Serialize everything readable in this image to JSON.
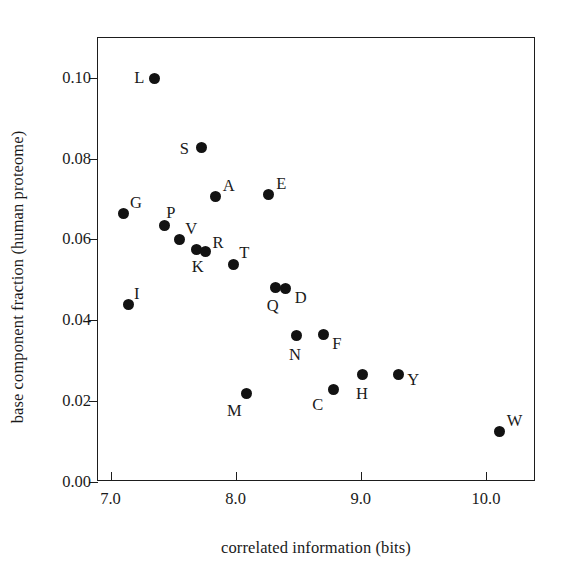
{
  "chart_data": {
    "type": "scatter",
    "title": "",
    "xlabel": "correlated information (bits)",
    "ylabel": "base component fraction (human proteome)",
    "xlim": [
      6.9,
      10.4
    ],
    "ylim": [
      0.0,
      0.1098
    ],
    "xticks": [
      "7.0",
      "8.0",
      "9.0",
      "10.0"
    ],
    "xtick_values": [
      7.0,
      8.0,
      9.0,
      10.0
    ],
    "yticks": [
      "0.00",
      "0.02",
      "0.04",
      "0.06",
      "0.08",
      "0.10"
    ],
    "ytick_values": [
      0.0,
      0.02,
      0.04,
      0.06,
      0.08,
      0.1
    ],
    "grid": false,
    "legend": false,
    "marker": "filled-circle",
    "marker_color": "#121212",
    "points": [
      {
        "label": "L",
        "x": 7.35,
        "y": 0.0999,
        "label_dx": -20,
        "label_dy": -8
      },
      {
        "label": "S",
        "x": 7.73,
        "y": 0.0826,
        "label_dx": -22,
        "label_dy": -7
      },
      {
        "label": "A",
        "x": 7.84,
        "y": 0.0706,
        "label_dx": 7,
        "label_dy": -19
      },
      {
        "label": "E",
        "x": 8.26,
        "y": 0.071,
        "label_dx": 8,
        "label_dy": -19
      },
      {
        "label": "G",
        "x": 7.1,
        "y": 0.0663,
        "label_dx": 7,
        "label_dy": -19
      },
      {
        "label": "P",
        "x": 7.43,
        "y": 0.0634,
        "label_dx": 2,
        "label_dy": -21
      },
      {
        "label": "V",
        "x": 7.55,
        "y": 0.0599,
        "label_dx": 6,
        "label_dy": -19
      },
      {
        "label": "K",
        "x": 7.69,
        "y": 0.0574,
        "label_dx": -5,
        "label_dy": 9
      },
      {
        "label": "R",
        "x": 7.76,
        "y": 0.0569,
        "label_dx": 7,
        "label_dy": -17
      },
      {
        "label": "T",
        "x": 7.98,
        "y": 0.0537,
        "label_dx": 6,
        "label_dy": -20
      },
      {
        "label": "I",
        "x": 7.14,
        "y": 0.0438,
        "label_dx": 6,
        "label_dy": -19
      },
      {
        "label": "Q",
        "x": 8.32,
        "y": 0.048,
        "label_dx": -9,
        "label_dy": 10
      },
      {
        "label": "D",
        "x": 8.4,
        "y": 0.0478,
        "label_dx": 9,
        "label_dy": 1
      },
      {
        "label": "N",
        "x": 8.49,
        "y": 0.0362,
        "label_dx": -8,
        "label_dy": 11
      },
      {
        "label": "F",
        "x": 8.7,
        "y": 0.0365,
        "label_dx": 9,
        "label_dy": 2
      },
      {
        "label": "Y",
        "x": 9.3,
        "y": 0.0267,
        "label_dx": 9,
        "label_dy": -2
      },
      {
        "label": "H",
        "x": 9.01,
        "y": 0.0265,
        "label_dx": -6,
        "label_dy": 11
      },
      {
        "label": "C",
        "x": 8.78,
        "y": 0.0228,
        "label_dx": -21,
        "label_dy": 7
      },
      {
        "label": "M",
        "x": 8.09,
        "y": 0.0218,
        "label_dx": -20,
        "label_dy": 9
      },
      {
        "label": "W",
        "x": 10.11,
        "y": 0.0124,
        "label_dx": 7,
        "label_dy": -19
      }
    ]
  }
}
